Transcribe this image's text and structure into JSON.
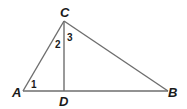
{
  "diagram": {
    "type": "triangle-with-altitude",
    "points": {
      "A": {
        "label": "A",
        "x": 23,
        "y": 91
      },
      "B": {
        "label": "B",
        "x": 168,
        "y": 91
      },
      "C": {
        "label": "C",
        "x": 64,
        "y": 21
      },
      "D": {
        "label": "D",
        "x": 64,
        "y": 91
      }
    },
    "segments": [
      "AC",
      "CB",
      "AB",
      "CD"
    ],
    "angles": {
      "angle1": {
        "label": "1",
        "vertex": "A"
      },
      "angle2": {
        "label": "2",
        "vertex": "C",
        "between": "CA-CD"
      },
      "angle3": {
        "label": "3",
        "vertex": "C",
        "between": "CD-CB"
      }
    },
    "colors": {
      "line": "#6e6e6e",
      "text": "#1a1a1a"
    }
  }
}
